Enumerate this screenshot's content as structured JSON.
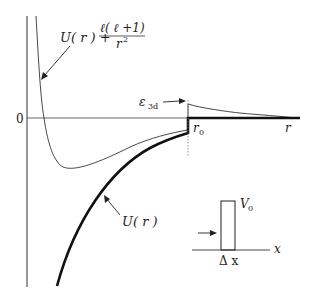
{
  "diagram": {
    "type": "physics-potential-diagram",
    "labels": {
      "effective_potential": "U(r) + ℓ(ℓ+1)/r²",
      "effective_potential_num_left": "U( r ) +",
      "effective_potential_num_frac": "ℓ( ℓ +1)",
      "effective_potential_den": "r",
      "effective_potential_den_exp": "2",
      "energy_level": "ε",
      "energy_level_sub": "3d",
      "zero": "0",
      "r0": "r",
      "r0_sub": "0",
      "r_axis": "r",
      "potential": "U( r )",
      "barrier_height": "V",
      "barrier_height_sub": "0",
      "barrier_width": "Δ x",
      "x_axis": "x"
    },
    "colors": {
      "line": "#222222",
      "background": "#ffffff"
    }
  }
}
